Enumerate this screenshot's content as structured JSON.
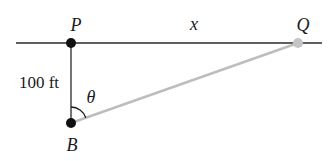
{
  "diagram": {
    "points": {
      "P": {
        "label": "P",
        "x": 71,
        "y": 43
      },
      "B": {
        "label": "B",
        "x": 71,
        "y": 123
      },
      "Q": {
        "label": "Q",
        "x": 298,
        "y": 43
      }
    },
    "labels": {
      "distance_pb": "100 ft",
      "distance_pq": "x",
      "angle": "θ"
    },
    "colors": {
      "line": "#2a2a2a",
      "sight_line": "#bdbdbd",
      "point": "#111111",
      "point_q": "#c4c4c4"
    }
  }
}
